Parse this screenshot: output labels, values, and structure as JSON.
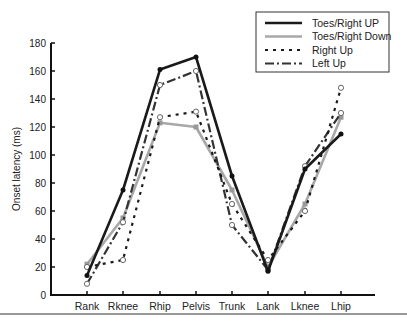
{
  "chart_data": {
    "type": "line",
    "title": "",
    "xlabel": "",
    "ylabel": "Onset latency (ms)",
    "ylim": [
      0,
      180
    ],
    "yticks": [
      0,
      20,
      40,
      60,
      80,
      100,
      120,
      140,
      160,
      180
    ],
    "categories": [
      "Rank",
      "Rknee",
      "Rhip",
      "Pelvis",
      "Trunk",
      "Lank",
      "Lknee",
      "Lhip"
    ],
    "grid": false,
    "legend_position": "upper right",
    "series": [
      {
        "name": "Toes/Right UP",
        "style": "solid",
        "color": "#1a1a1a",
        "values": [
          14,
          75,
          161,
          170,
          85,
          17,
          90,
          115
        ]
      },
      {
        "name": "Toes/Right Down",
        "style": "solid-gray",
        "color": "#a8a8a8",
        "values": [
          22,
          55,
          123,
          120,
          75,
          20,
          65,
          127
        ]
      },
      {
        "name": "Right Up",
        "style": "dotted",
        "color": "#1a1a1a",
        "values": [
          20,
          25,
          127,
          131,
          65,
          25,
          60,
          148
        ]
      },
      {
        "name": "Left Up",
        "style": "dash-dot",
        "color": "#333333",
        "values": [
          8,
          52,
          150,
          160,
          50,
          18,
          92,
          130
        ]
      }
    ]
  }
}
